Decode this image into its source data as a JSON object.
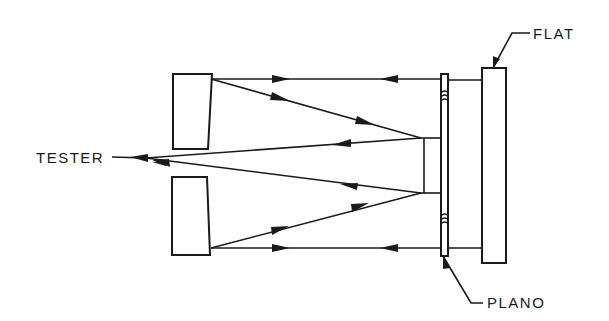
{
  "diagram": {
    "type": "optical-test-setup",
    "labels": {
      "tester": "TESTER",
      "flat": "FLAT",
      "plano": "PLANO"
    },
    "components": [
      {
        "name": "upper-mirror",
        "kind": "mirror block (wedge)"
      },
      {
        "name": "lower-mirror",
        "kind": "mirror block (wedge)"
      },
      {
        "name": "central-mirror",
        "kind": "small flat mirror"
      },
      {
        "name": "plano",
        "kind": "thin plano plate"
      },
      {
        "name": "flat",
        "kind": "reference flat"
      }
    ],
    "colors": {
      "line": "#1a1a1a",
      "background": "#ffffff"
    }
  }
}
